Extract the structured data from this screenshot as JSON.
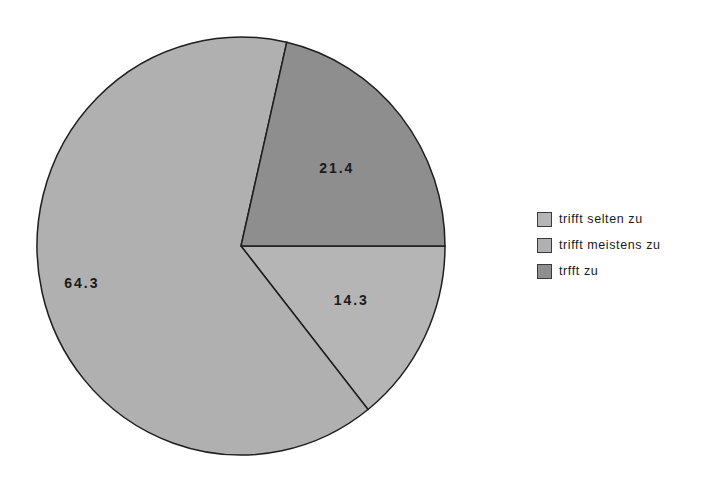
{
  "chart_data": {
    "type": "pie",
    "title": "",
    "categories": [
      "trifft selten zu",
      "trifft meistens zu",
      "trfft zu"
    ],
    "values": [
      14.3,
      64.3,
      21.4
    ],
    "labels": [
      "14.3",
      "64.3",
      "21.4"
    ],
    "colors": [
      "#b5b5b5",
      "#b0b0b0",
      "#8e8e8e"
    ],
    "legend_position": "right",
    "start_angle_deg": 0,
    "direction": "clockwise"
  },
  "legend": {
    "items": [
      {
        "label": "trifft selten zu",
        "color": "#b5b5b5"
      },
      {
        "label": "trifft meistens zu",
        "color": "#b0b0b0"
      },
      {
        "label": "trfft zu",
        "color": "#8e8e8e"
      }
    ]
  }
}
